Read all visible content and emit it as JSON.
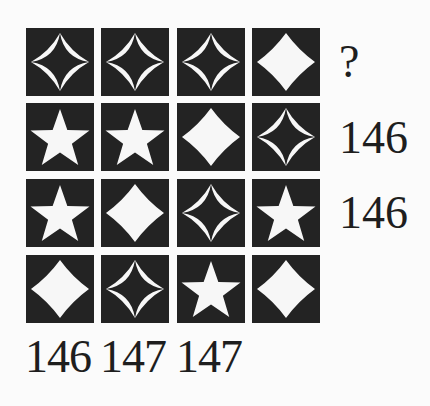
{
  "puzzle": {
    "grid": [
      [
        "outline-star4",
        "outline-star4",
        "outline-star4",
        "solid-star4"
      ],
      [
        "star5",
        "star5",
        "solid-star4",
        "outline-star4"
      ],
      [
        "star5",
        "solid-star4",
        "outline-star4",
        "star5"
      ],
      [
        "solid-star4",
        "outline-star4",
        "star5",
        "solid-star4"
      ]
    ],
    "row_labels": [
      "?",
      "146",
      "146",
      ""
    ],
    "col_labels": [
      "146",
      "147",
      "147",
      ""
    ]
  },
  "colors": {
    "background": "#fbfbfb",
    "tile": "#232323",
    "shape": "#f7f7f7",
    "text": "#1e1e1e"
  }
}
